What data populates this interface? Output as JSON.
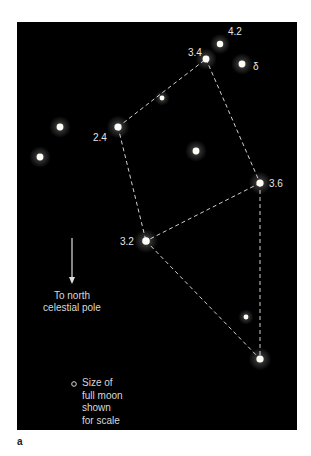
{
  "figure": {
    "panel_letter": "a",
    "background": "#000000",
    "line_color": "#d0d0d0",
    "stars": [
      {
        "id": "s1",
        "x": 220,
        "y": 44,
        "r": 3.2,
        "label": "4.2"
      },
      {
        "id": "s2",
        "x": 206,
        "y": 59,
        "r": 3.4,
        "label": "3.4"
      },
      {
        "id": "s3",
        "x": 242,
        "y": 64,
        "r": 3.4,
        "label": "δ"
      },
      {
        "id": "s4",
        "x": 162,
        "y": 98,
        "r": 2.4,
        "label": ""
      },
      {
        "id": "s5",
        "x": 118,
        "y": 127,
        "r": 3.6,
        "label": "2.4"
      },
      {
        "id": "s6",
        "x": 60,
        "y": 127,
        "r": 3.4,
        "label": ""
      },
      {
        "id": "s7",
        "x": 40,
        "y": 157,
        "r": 3.4,
        "label": ""
      },
      {
        "id": "s8",
        "x": 196,
        "y": 151,
        "r": 3.4,
        "label": ""
      },
      {
        "id": "s9",
        "x": 260,
        "y": 183,
        "r": 3.6,
        "label": "3.6"
      },
      {
        "id": "s10",
        "x": 146,
        "y": 241,
        "r": 3.8,
        "label": "3.2"
      },
      {
        "id": "s11",
        "x": 246,
        "y": 317,
        "r": 2.4,
        "label": ""
      },
      {
        "id": "s12",
        "x": 260,
        "y": 359,
        "r": 3.6,
        "label": ""
      }
    ],
    "lines": [
      [
        "s5",
        "s2"
      ],
      [
        "s2",
        "s9"
      ],
      [
        "s9",
        "s10"
      ],
      [
        "s5",
        "s10"
      ],
      [
        "s10",
        "s12"
      ],
      [
        "s9",
        "s12"
      ]
    ],
    "labels": [
      {
        "text": "4.2",
        "x": 228,
        "y": 26
      },
      {
        "text": "3.4",
        "x": 188,
        "y": 47
      },
      {
        "text": "δ",
        "x": 253,
        "y": 61
      },
      {
        "text": "2.4",
        "x": 93,
        "y": 132
      },
      {
        "text": "3.6",
        "x": 269,
        "y": 178
      },
      {
        "text": "3.2",
        "x": 120,
        "y": 236
      }
    ],
    "arrow": {
      "x": 72,
      "y1": 238,
      "y2": 284,
      "caption": [
        "To north",
        "celestial pole"
      ]
    },
    "legend": {
      "lines": [
        "Size of",
        "full moon",
        "shown",
        "for scale"
      ]
    }
  }
}
